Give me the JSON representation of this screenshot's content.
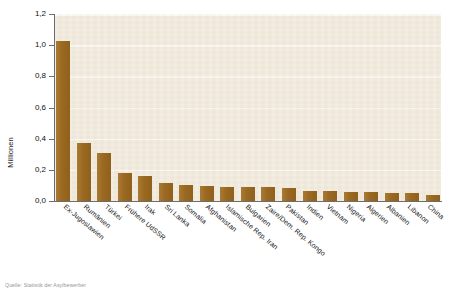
{
  "chart_data": {
    "type": "bar",
    "title": "",
    "subtitle": "",
    "xlabel": "",
    "ylabel": "Millionen",
    "ylim": [
      0,
      1.2
    ],
    "ytick_labels": [
      "1,2",
      "1,0",
      "0,8",
      "0,6",
      "0,4",
      "0,2",
      "0,0"
    ],
    "ytick_values": [
      1.2,
      1.0,
      0.8,
      0.6,
      0.4,
      0.2,
      0.0
    ],
    "grid": "horizontal",
    "legend": "none",
    "bar_color": "#9d6b23",
    "plot_background": "#f3ecdf",
    "categories": [
      "Ex-Jugoslawien",
      "Rumänien",
      "Türkei",
      "Frühere UdSSR",
      "Irak",
      "Sri Lanka",
      "Somalia",
      "Afghanistan",
      "Islamische Rep. Iran",
      "Bulgarien",
      "Zaire/Dem. Rep. Kongo",
      "Pakistan",
      "Indien",
      "Vietnam",
      "Nigeria",
      "Algerien",
      "Albanien",
      "Libanon",
      "China"
    ],
    "values": [
      1.03,
      0.37,
      0.31,
      0.18,
      0.16,
      0.115,
      0.1,
      0.095,
      0.093,
      0.09,
      0.09,
      0.085,
      0.065,
      0.062,
      0.055,
      0.055,
      0.052,
      0.05,
      0.04
    ]
  },
  "axis": {
    "y_title": "Millionen"
  },
  "footnote": "Quelle: Statistik der Asylbewerber"
}
